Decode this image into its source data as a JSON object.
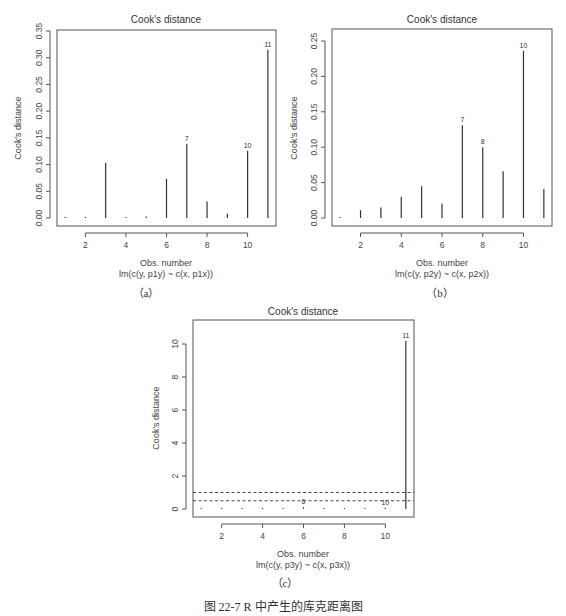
{
  "figure": {
    "caption": "图 22-7   R 中产生的库克距离图",
    "sublabels": [
      "（a）",
      "（b）",
      "（c）"
    ]
  },
  "chart_data": [
    {
      "type": "bar",
      "id": "a",
      "title": "Cook's distance",
      "xlabel": "Obs. number",
      "xsublabel": "lm(c(y, p1y) ~ c(x, p1x))",
      "ylabel": "Cook's distance",
      "x": [
        1,
        2,
        3,
        4,
        5,
        6,
        7,
        8,
        9,
        10,
        11
      ],
      "values": [
        0.002,
        0.0005,
        0.103,
        0.002,
        0.003,
        0.073,
        0.139,
        0.031,
        0.008,
        0.126,
        0.315
      ],
      "point_labels": [
        {
          "x": 7,
          "label": "7"
        },
        {
          "x": 10,
          "label": "10"
        },
        {
          "x": 11,
          "label": "11"
        }
      ],
      "xticks": [
        2,
        4,
        6,
        8,
        10
      ],
      "yticks": [
        "0.00",
        "0.05",
        "0.10",
        "0.15",
        "0.20",
        "0.25",
        "0.30",
        "0.35"
      ],
      "ylim": [
        0,
        0.35
      ],
      "xlim": [
        0.6,
        11.4
      ],
      "grid": false
    },
    {
      "type": "bar",
      "id": "b",
      "title": "Cook's distance",
      "xlabel": "Obs. number",
      "xsublabel": "lm(c(y, p2y) ~ c(x, p2x))",
      "ylabel": "Cook's distance",
      "x": [
        1,
        2,
        3,
        4,
        5,
        6,
        7,
        8,
        9,
        10,
        11
      ],
      "values": [
        0.0005,
        0.011,
        0.015,
        0.03,
        0.045,
        0.02,
        0.131,
        0.1,
        0.066,
        0.236,
        0.041
      ],
      "point_labels": [
        {
          "x": 7,
          "label": "7"
        },
        {
          "x": 8,
          "label": "8"
        },
        {
          "x": 10,
          "label": "10"
        }
      ],
      "xticks": [
        2,
        4,
        6,
        8,
        10
      ],
      "yticks": [
        "0.00",
        "0.05",
        "0.10",
        "0.15",
        "0.20",
        "0.25"
      ],
      "ylim": [
        0,
        0.25
      ],
      "xlim": [
        0.6,
        11.4
      ],
      "grid": false
    },
    {
      "type": "bar",
      "id": "c",
      "title": "Cook's distance",
      "xlabel": "Obs. number",
      "xsublabel": "lm(c(y, p3y) ~ c(x, p3x))",
      "ylabel": "Cook's distance",
      "x": [
        1,
        2,
        3,
        4,
        5,
        6,
        7,
        8,
        9,
        10,
        11
      ],
      "values": [
        0.02,
        0.02,
        0.04,
        0.03,
        0.02,
        0.1,
        0.02,
        0.04,
        0.03,
        0.08,
        10.2
      ],
      "point_labels": [
        {
          "x": 6,
          "label": "6"
        },
        {
          "x": 10,
          "label": "10"
        },
        {
          "x": 11,
          "label": "11"
        }
      ],
      "reference_lines": [
        0.5,
        1.0
      ],
      "xticks": [
        2,
        4,
        6,
        8,
        10
      ],
      "yticks": [
        "0",
        "2",
        "4",
        "6",
        "8",
        "10"
      ],
      "ylim": [
        0,
        10.2
      ],
      "xlim": [
        0.6,
        11.4
      ],
      "grid": false
    }
  ]
}
